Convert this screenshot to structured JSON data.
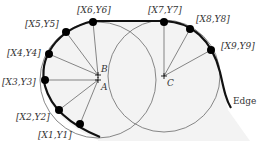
{
  "diagram": {
    "edge_label": "Edge",
    "centers": [
      {
        "id": "A",
        "label": "A"
      },
      {
        "id": "B",
        "label": "B"
      },
      {
        "id": "C",
        "label": "C"
      }
    ],
    "edge_points": [
      {
        "id": "p1",
        "label": "[X1,Y1]"
      },
      {
        "id": "p2",
        "label": "[X2,Y2]"
      },
      {
        "id": "p3",
        "label": "[X3,Y3]"
      },
      {
        "id": "p4",
        "label": "[X4,Y4]"
      },
      {
        "id": "p5",
        "label": "[X5,Y5]"
      },
      {
        "id": "p6",
        "label": "[X6,Y6]"
      },
      {
        "id": "p7",
        "label": "[X7,Y7]"
      },
      {
        "id": "p8",
        "label": "[X8,Y8]"
      },
      {
        "id": "p9",
        "label": "[X9,Y9]"
      }
    ],
    "colors": {
      "edge": "#111111",
      "circle": "#666666",
      "fill": "#f2f2f2",
      "spoke": "#555555",
      "point": "#000000"
    }
  }
}
